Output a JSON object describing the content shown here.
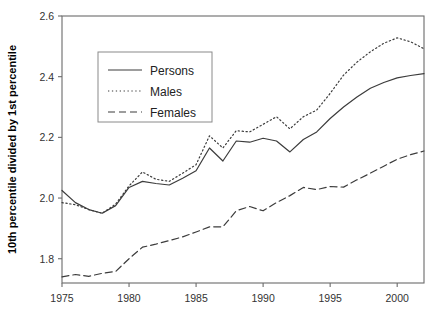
{
  "chart_data": {
    "type": "line",
    "title": "",
    "subtitle": "",
    "xlabel": "",
    "ylabel": "10th percentile divided by 1st percentile",
    "xlim": [
      1975,
      2002
    ],
    "ylim": [
      1.72,
      2.6
    ],
    "grid": false,
    "legend_position": "upper-left",
    "x_ticks": [
      "1975",
      "1980",
      "1985",
      "1990",
      "1995",
      "2000"
    ],
    "x_tick_values": [
      1975,
      1980,
      1985,
      1990,
      1995,
      2000
    ],
    "y_ticks": [
      "1.8",
      "2.0",
      "2.2",
      "2.4",
      "2.6"
    ],
    "y_tick_values": [
      1.8,
      2.0,
      2.2,
      2.4,
      2.6
    ],
    "x": [
      1975,
      1976,
      1977,
      1978,
      1979,
      1980,
      1981,
      1982,
      1983,
      1984,
      1985,
      1986,
      1987,
      1988,
      1989,
      1990,
      1991,
      1992,
      1993,
      1994,
      1995,
      1996,
      1997,
      1998,
      1999,
      2000,
      2001,
      2002
    ],
    "series": [
      {
        "name": "Persons",
        "style": "solid",
        "color": "#3c3c3c",
        "values": [
          2.025,
          1.985,
          1.962,
          1.95,
          1.975,
          2.035,
          2.055,
          2.048,
          2.043,
          2.065,
          2.09,
          2.165,
          2.122,
          2.188,
          2.184,
          2.197,
          2.188,
          2.152,
          2.193,
          2.218,
          2.262,
          2.3,
          2.333,
          2.362,
          2.381,
          2.396,
          2.404,
          2.41
        ]
      },
      {
        "name": "Males",
        "style": "dotted",
        "color": "#6a6a6a",
        "values": [
          1.985,
          1.978,
          1.962,
          1.95,
          1.98,
          2.04,
          2.086,
          2.062,
          2.055,
          2.082,
          2.11,
          2.205,
          2.165,
          2.222,
          2.218,
          2.243,
          2.268,
          2.228,
          2.268,
          2.29,
          2.345,
          2.405,
          2.448,
          2.482,
          2.51,
          2.528,
          2.515,
          2.492
        ]
      },
      {
        "name": "Females",
        "style": "dashed",
        "color": "#4a4a4a",
        "values": [
          1.74,
          1.748,
          1.742,
          1.752,
          1.758,
          1.8,
          1.838,
          1.848,
          1.86,
          1.872,
          1.888,
          1.905,
          1.905,
          1.958,
          1.972,
          1.958,
          1.985,
          2.008,
          2.035,
          2.028,
          2.038,
          2.036,
          2.06,
          2.082,
          2.105,
          2.128,
          2.143,
          2.155
        ]
      }
    ]
  },
  "legend": {
    "items": [
      {
        "label": "Persons"
      },
      {
        "label": "Males"
      },
      {
        "label": "Females"
      }
    ]
  }
}
